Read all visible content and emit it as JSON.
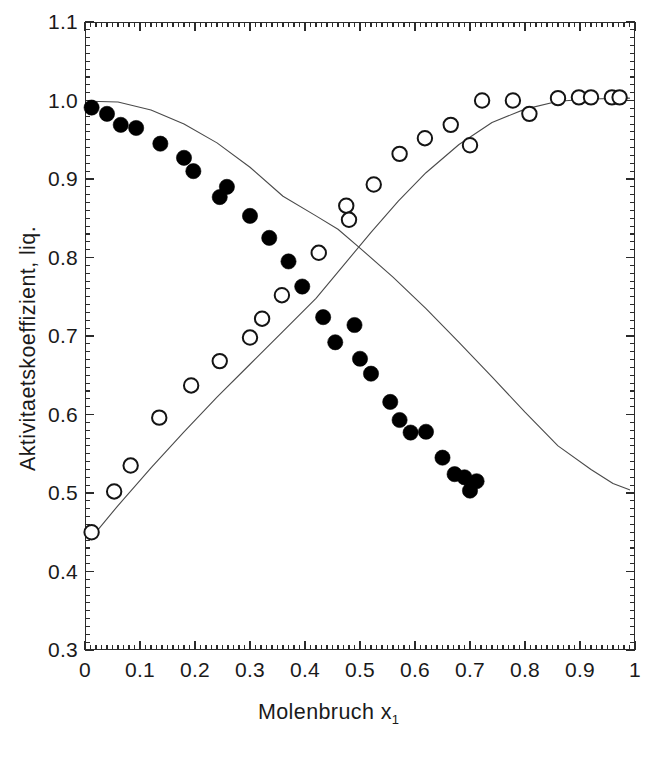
{
  "chart_data": {
    "type": "scatter",
    "title": "",
    "xlabel": "Molenbruch x",
    "xlabel_sub": "1",
    "ylabel": "Aktivitaetskoeffizient, liq.",
    "xlim": [
      0,
      1
    ],
    "ylim": [
      0.3,
      1.1
    ],
    "xticks": [
      0,
      0.1,
      0.2,
      0.3,
      0.4,
      0.5,
      0.6,
      0.7,
      0.8,
      0.9,
      1
    ],
    "xtick_labels": [
      "0",
      "0.1",
      "0.2",
      "0.3",
      "0.4",
      "0.5",
      "0.6",
      "0.7",
      "0.8",
      "0.9",
      "1"
    ],
    "yticks": [
      0.3,
      0.4,
      0.5,
      0.6,
      0.7,
      0.8,
      0.9,
      1.0,
      1.1
    ],
    "ytick_labels": [
      "0.3",
      "0.4",
      "0.5",
      "0.6",
      "0.7",
      "0.8",
      "0.9",
      "1.0",
      "1.1"
    ],
    "minor_ticks_per_interval": 10,
    "grid": false,
    "legend": "none",
    "frame": "box",
    "series": [
      {
        "name": "gamma-1-filled",
        "marker": "filled-circle",
        "color": "#000000",
        "points": [
          [
            0.012,
            0.991
          ],
          [
            0.04,
            0.983
          ],
          [
            0.065,
            0.969
          ],
          [
            0.093,
            0.965
          ],
          [
            0.137,
            0.945
          ],
          [
            0.18,
            0.927
          ],
          [
            0.197,
            0.91
          ],
          [
            0.245,
            0.877
          ],
          [
            0.258,
            0.89
          ],
          [
            0.3,
            0.853
          ],
          [
            0.335,
            0.825
          ],
          [
            0.37,
            0.795
          ],
          [
            0.395,
            0.763
          ],
          [
            0.433,
            0.724
          ],
          [
            0.455,
            0.692
          ],
          [
            0.49,
            0.714
          ],
          [
            0.5,
            0.671
          ],
          [
            0.52,
            0.652
          ],
          [
            0.555,
            0.616
          ],
          [
            0.572,
            0.593
          ],
          [
            0.592,
            0.577
          ],
          [
            0.62,
            0.578
          ],
          [
            0.65,
            0.545
          ],
          [
            0.672,
            0.524
          ],
          [
            0.69,
            0.52
          ],
          [
            0.7,
            0.503
          ],
          [
            0.712,
            0.515
          ]
        ]
      },
      {
        "name": "gamma-2-open",
        "marker": "open-circle",
        "color": "#000000",
        "points": [
          [
            0.012,
            0.45
          ],
          [
            0.053,
            0.502
          ],
          [
            0.083,
            0.535
          ],
          [
            0.135,
            0.596
          ],
          [
            0.193,
            0.637
          ],
          [
            0.245,
            0.668
          ],
          [
            0.3,
            0.698
          ],
          [
            0.322,
            0.722
          ],
          [
            0.358,
            0.752
          ],
          [
            0.425,
            0.806
          ],
          [
            0.475,
            0.866
          ],
          [
            0.48,
            0.848
          ],
          [
            0.525,
            0.893
          ],
          [
            0.572,
            0.932
          ],
          [
            0.618,
            0.952
          ],
          [
            0.665,
            0.969
          ],
          [
            0.7,
            0.943
          ],
          [
            0.722,
            1.0
          ],
          [
            0.778,
            1.0
          ],
          [
            0.808,
            0.983
          ],
          [
            0.86,
            1.003
          ],
          [
            0.898,
            1.004
          ],
          [
            0.92,
            1.004
          ],
          [
            0.958,
            1.004
          ],
          [
            0.972,
            1.004
          ]
        ]
      }
    ],
    "curves": [
      {
        "name": "fit-curve-descending",
        "color": "#4a4a4a",
        "points": [
          [
            0.008,
            0.999
          ],
          [
            0.06,
            0.998
          ],
          [
            0.12,
            0.988
          ],
          [
            0.18,
            0.97
          ],
          [
            0.24,
            0.946
          ],
          [
            0.3,
            0.915
          ],
          [
            0.36,
            0.878
          ],
          [
            0.42,
            0.853
          ],
          [
            0.46,
            0.836
          ],
          [
            0.5,
            0.812
          ],
          [
            0.56,
            0.775
          ],
          [
            0.62,
            0.735
          ],
          [
            0.68,
            0.692
          ],
          [
            0.74,
            0.648
          ],
          [
            0.8,
            0.603
          ],
          [
            0.86,
            0.56
          ],
          [
            0.92,
            0.53
          ],
          [
            0.96,
            0.512
          ],
          [
            0.99,
            0.504
          ]
        ]
      },
      {
        "name": "fit-curve-ascending",
        "color": "#4a4a4a",
        "points": [
          [
            0.008,
            0.44
          ],
          [
            0.06,
            0.484
          ],
          [
            0.12,
            0.532
          ],
          [
            0.18,
            0.578
          ],
          [
            0.24,
            0.622
          ],
          [
            0.3,
            0.664
          ],
          [
            0.36,
            0.706
          ],
          [
            0.42,
            0.748
          ],
          [
            0.47,
            0.79
          ],
          [
            0.52,
            0.832
          ],
          [
            0.57,
            0.872
          ],
          [
            0.62,
            0.908
          ],
          [
            0.68,
            0.944
          ],
          [
            0.74,
            0.972
          ],
          [
            0.8,
            0.989
          ],
          [
            0.86,
            0.999
          ],
          [
            0.92,
            1.002
          ],
          [
            0.99,
            1.003
          ]
        ]
      }
    ]
  }
}
